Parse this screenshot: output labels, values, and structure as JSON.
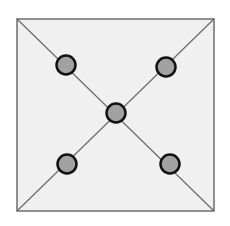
{
  "diagram": {
    "square": {
      "x": 17,
      "y": 19,
      "width": 197,
      "height": 192,
      "fill": "#f0f0f0",
      "stroke": "#6e6e6e"
    },
    "diagonals": [
      {
        "x1": 17,
        "y1": 19,
        "x2": 214,
        "y2": 211
      },
      {
        "x1": 214,
        "y1": 19,
        "x2": 17,
        "y2": 211
      }
    ],
    "nodes": [
      {
        "id": "top-left",
        "cx": 66,
        "cy": 65,
        "r": 9.5
      },
      {
        "id": "top-right",
        "cx": 166,
        "cy": 67,
        "r": 9.5
      },
      {
        "id": "center",
        "cx": 116,
        "cy": 113,
        "r": 9.5
      },
      {
        "id": "bottom-left",
        "cx": 67,
        "cy": 164,
        "r": 9.5
      },
      {
        "id": "bottom-right",
        "cx": 170,
        "cy": 164,
        "r": 9.5
      }
    ],
    "node_fill": "#a2a2a2",
    "node_stroke": "#111111",
    "line_color": "#6a6a6a"
  }
}
